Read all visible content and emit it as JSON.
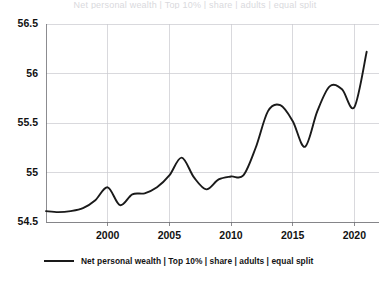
{
  "chart_data": {
    "type": "line",
    "title": "",
    "xlabel": "",
    "ylabel": "",
    "xlim": [
      1995,
      2022
    ],
    "ylim": [
      54.5,
      56.5
    ],
    "grid": true,
    "legend_position": "bottom-left",
    "x_ticks": [
      "2000",
      "2005",
      "2010",
      "2015",
      "2020"
    ],
    "x_tick_values": [
      2000,
      2005,
      2010,
      2015,
      2020
    ],
    "y_ticks": [
      "54.5",
      "55",
      "55.5",
      "56",
      "56.5"
    ],
    "y_tick_values": [
      54.5,
      55,
      55.5,
      56,
      56.5
    ],
    "series": [
      {
        "name": "Net personal wealth | Top 10% | share | adults | equal split",
        "color": "#1a1a1a",
        "x": [
          1995,
          1996,
          1997,
          1998,
          1999,
          2000,
          2001,
          2002,
          2003,
          2004,
          2005,
          2006,
          2007,
          2008,
          2009,
          2010,
          2011,
          2012,
          2013,
          2014,
          2015,
          2016,
          2017,
          2018,
          2019,
          2020,
          2021
        ],
        "values": [
          54.61,
          54.6,
          54.61,
          54.64,
          54.72,
          54.85,
          54.67,
          54.78,
          54.79,
          54.85,
          54.97,
          55.15,
          54.95,
          54.83,
          54.93,
          54.96,
          54.97,
          55.25,
          55.62,
          55.68,
          55.52,
          55.26,
          55.62,
          55.87,
          55.84,
          55.66,
          56.22
        ]
      }
    ]
  },
  "legend": {
    "entries": [
      {
        "label": "Net personal wealth | Top 10% | share | adults | equal split",
        "color": "#1a1a1a"
      }
    ]
  },
  "page": {
    "clipped_header": "Net personal wealth | Top 10% | share | adults | equal split"
  },
  "colors": {
    "line": "#1a1a1a",
    "grid": "#c9c9cf",
    "axis": "#6f6f74",
    "background": "#ffffff",
    "text": "#121212"
  }
}
